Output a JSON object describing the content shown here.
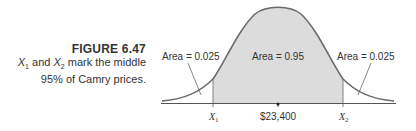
{
  "caption": {
    "title": "FIGURE 6.47",
    "line1_x1": "X",
    "line1_x1_sub": "1",
    "line1_mid": " and ",
    "line1_x2": "X",
    "line1_x2_sub": "2",
    "line1_end": " mark the middle",
    "line2": "95% of Camry prices."
  },
  "diagram": {
    "type": "normal-distribution",
    "mean_label": "$23,400",
    "x1_label": "X",
    "x1_sub": "1",
    "x2_label": "X",
    "x2_sub": "2",
    "left_area_label": "Area = 0.025",
    "center_area_label": "Area = 0.95",
    "right_area_label": "Area = 0.025",
    "colors": {
      "curve": "#6b6b6b",
      "shade": "#dcdcdc",
      "axis": "#555555",
      "text": "#333333"
    }
  }
}
